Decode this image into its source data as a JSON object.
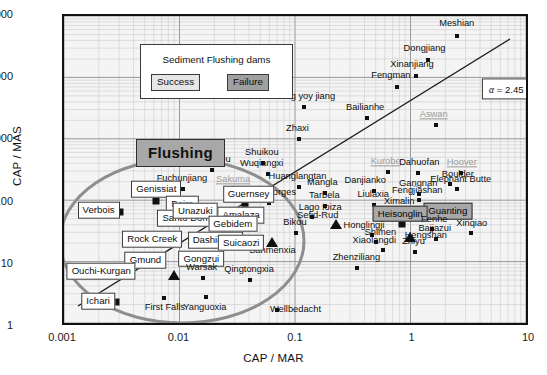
{
  "chart_data": {
    "type": "scatter",
    "title": "Sediment Flushing dams",
    "xlabel": "CAP / MAR",
    "ylabel": "CAP / MAS",
    "xscale": "log",
    "yscale": "log",
    "xlim": [
      0.001,
      10
    ],
    "ylim": [
      1,
      100000
    ],
    "xticks": [
      "0.001",
      "0.01",
      "0.1",
      "1",
      "10"
    ],
    "yticks": [
      "1",
      "10",
      "100",
      "1000",
      "10000",
      "100000"
    ],
    "grid": true,
    "legend": {
      "position": "top-left",
      "title": "Sediment Flushing dams",
      "entries": [
        {
          "label": "Success",
          "style": "light-box"
        },
        {
          "label": "Failure",
          "style": "dark-box"
        }
      ]
    },
    "annotations": [
      {
        "text": "Flushing",
        "kind": "region-tag",
        "x": 0.0018,
        "y": 900
      },
      {
        "text": "α = 2.45 × 10³",
        "kind": "trendline-equation",
        "x": 2.4,
        "y": 5200
      }
    ],
    "trendline": {
      "kind": "power-law",
      "alpha": 2450,
      "x0": 0.0013,
      "y0": 2.2,
      "x1": 5.0,
      "y1": 42000
    },
    "ellipse": {
      "kind": "highlight-ellipse",
      "cx": 0.0048,
      "cy": 19,
      "label": "flushing-success-cluster"
    },
    "points": [
      {
        "name": "Meshian",
        "x": 2.35,
        "y": 47000,
        "marker": "dot"
      },
      {
        "name": "Dongjiang",
        "x": 1.32,
        "y": 19500,
        "marker": "dot"
      },
      {
        "name": "Xinanjiang",
        "x": 1.05,
        "y": 11000,
        "marker": "dot"
      },
      {
        "name": "Fengman",
        "x": 0.72,
        "y": 7200,
        "marker": "dot"
      },
      {
        "name": "Shang yoy jiang",
        "x": 0.115,
        "y": 3400,
        "marker": "dot"
      },
      {
        "name": "Bailianhe",
        "x": 0.4,
        "y": 2300,
        "marker": "dot"
      },
      {
        "name": "Aswan",
        "x": 1.55,
        "y": 1750,
        "marker": "dot",
        "style": "grey"
      },
      {
        "name": "Zhaxi",
        "x": 0.105,
        "y": 1050,
        "marker": "dot"
      },
      {
        "name": "Shuikou",
        "x": 0.051,
        "y": 440,
        "marker": "dot"
      },
      {
        "name": "Huantankou",
        "x": 0.0185,
        "y": 330,
        "marker": "dot"
      },
      {
        "name": "Wuqiangxi",
        "x": 0.056,
        "y": 290,
        "marker": "dot"
      },
      {
        "name": "Kurobe",
        "x": 0.6,
        "y": 310,
        "marker": "dot",
        "style": "grey"
      },
      {
        "name": "Dahuofan",
        "x": 1.1,
        "y": 300,
        "marker": "dot"
      },
      {
        "name": "Hoover",
        "x": 2.55,
        "y": 300,
        "marker": "dot",
        "style": "grey"
      },
      {
        "name": "Sakuma",
        "x": 0.03,
        "y": 160,
        "marker": "dot",
        "style": "grey"
      },
      {
        "name": "Huanglangtan",
        "x": 0.105,
        "y": 180,
        "marker": "dot"
      },
      {
        "name": "Mangla",
        "x": 0.175,
        "y": 145,
        "marker": "dot"
      },
      {
        "name": "Danjianko",
        "x": 0.46,
        "y": 155,
        "marker": "dot"
      },
      {
        "name": "Gangnan",
        "x": 1.12,
        "y": 140,
        "marker": "dot"
      },
      {
        "name": "Boulder",
        "x": 2.05,
        "y": 200,
        "marker": "dot"
      },
      {
        "name": "Elephant Butte",
        "x": 2.35,
        "y": 165,
        "marker": "dot"
      },
      {
        "name": "Fengjiashan",
        "x": 1.12,
        "y": 110,
        "marker": "dot"
      },
      {
        "name": "Fuchunjiang",
        "x": 0.0105,
        "y": 165,
        "marker": "dot"
      },
      {
        "name": "Three Gorges",
        "x": 0.058,
        "y": 100,
        "marker": "dot"
      },
      {
        "name": "Tarbela",
        "x": 0.175,
        "y": 88,
        "marker": "dot"
      },
      {
        "name": "Liulaxia",
        "x": 0.46,
        "y": 92,
        "marker": "dot"
      },
      {
        "name": "Ximalin",
        "x": 0.9,
        "y": 72,
        "marker": "dot"
      },
      {
        "name": "Guanting",
        "x": 1.3,
        "y": 72,
        "marker": "square",
        "flush": "failure"
      },
      {
        "name": "Lago Ioiza",
        "x": 0.135,
        "y": 58,
        "marker": "dot"
      },
      {
        "name": "Sefid-Rud",
        "x": 0.215,
        "y": 46,
        "marker": "triangle"
      },
      {
        "name": "Heisonglin",
        "x": 0.8,
        "y": 46,
        "marker": "square",
        "flush": "failure"
      },
      {
        "name": "Fenhe",
        "x": 1.45,
        "y": 38,
        "marker": "dot"
      },
      {
        "name": "Xinqiao",
        "x": 3.1,
        "y": 33,
        "marker": "dot"
      },
      {
        "name": "Bikou",
        "x": 0.098,
        "y": 32,
        "marker": "dot"
      },
      {
        "name": "Honglingji",
        "x": 0.44,
        "y": 30,
        "marker": "dot"
      },
      {
        "name": "Hengshan",
        "x": 0.93,
        "y": 28,
        "marker": "triangle"
      },
      {
        "name": "Bajiazui",
        "x": 1.55,
        "y": 26,
        "marker": "dot"
      },
      {
        "name": "Sanmenxia",
        "x": 0.0615,
        "y": 23,
        "marker": "triangle"
      },
      {
        "name": "Shimen",
        "x": 0.48,
        "y": 23,
        "marker": "dot"
      },
      {
        "name": "Xiaolangdi",
        "x": 0.55,
        "y": 17,
        "marker": "dot"
      },
      {
        "name": "Zhiyu",
        "x": 1.02,
        "y": 16,
        "marker": "dot"
      },
      {
        "name": "Zhenziliang",
        "x": 0.33,
        "y": 9,
        "marker": "dot"
      },
      {
        "name": "Genissiat",
        "x": 0.0062,
        "y": 105,
        "marker": "square",
        "flush": "success"
      },
      {
        "name": "Baira",
        "x": 0.0082,
        "y": 88,
        "marker": "square",
        "flush": "success"
      },
      {
        "name": "Verbois",
        "x": 0.003,
        "y": 70,
        "marker": "square",
        "flush": "success"
      },
      {
        "name": "Santo Domingo",
        "x": 0.0098,
        "y": 52,
        "marker": "square",
        "flush": "success"
      },
      {
        "name": "Guernsey",
        "x": 0.0355,
        "y": 90,
        "marker": "square",
        "flush": "success"
      },
      {
        "name": "Amalaza",
        "x": 0.0345,
        "y": 60,
        "marker": "square",
        "flush": "success"
      },
      {
        "name": "Unazuki",
        "x": 0.0145,
        "y": 49,
        "marker": "square",
        "flush": "success"
      },
      {
        "name": "Gebidem",
        "x": 0.0205,
        "y": 44,
        "marker": "square",
        "flush": "success"
      },
      {
        "name": "Rock Creek",
        "x": 0.0085,
        "y": 24,
        "marker": "square",
        "flush": "success"
      },
      {
        "name": "Dashidaira",
        "x": 0.0143,
        "y": 24,
        "marker": "square",
        "flush": "success"
      },
      {
        "name": "Suicaozi",
        "x": 0.0215,
        "y": 22,
        "marker": "square",
        "flush": "success"
      },
      {
        "name": "Gmund",
        "x": 0.0066,
        "y": 11.5,
        "marker": "square",
        "flush": "success"
      },
      {
        "name": "Gongzui",
        "x": 0.0108,
        "y": 12,
        "marker": "square",
        "flush": "success"
      },
      {
        "name": "Ouchi-Kurgan",
        "x": 0.0031,
        "y": 7.6,
        "marker": "square",
        "flush": "success"
      },
      {
        "name": "Warsak",
        "x": 0.0155,
        "y": 6.2,
        "marker": "dot"
      },
      {
        "name": "Qingtongxia",
        "x": 0.0395,
        "y": 5.6,
        "marker": "dot"
      },
      {
        "name": "Ichari",
        "x": 0.0028,
        "y": 2.5,
        "marker": "square",
        "flush": "success"
      },
      {
        "name": "First Falls",
        "x": 0.0072,
        "y": 2.9,
        "marker": "dot"
      },
      {
        "name": "Yanguoxia",
        "x": 0.0165,
        "y": 3.0,
        "marker": "dot"
      },
      {
        "name": "Wellbedacht",
        "x": 0.068,
        "y": 1.9,
        "marker": "dot"
      },
      {
        "name": "unnamed-tri-a",
        "x": 0.0088,
        "y": 6.8,
        "marker": "triangle"
      }
    ]
  }
}
